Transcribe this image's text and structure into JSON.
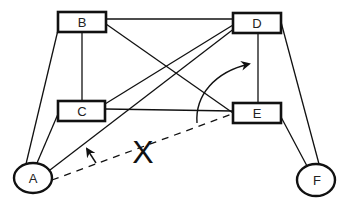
{
  "diagram": {
    "nodes": [
      {
        "id": "B",
        "label": "B",
        "shape": "rect",
        "x": 58,
        "y": 12,
        "w": 48,
        "h": 20
      },
      {
        "id": "C",
        "label": "C",
        "shape": "rect",
        "x": 58,
        "y": 101,
        "w": 47,
        "h": 20
      },
      {
        "id": "D",
        "label": "D",
        "shape": "rect",
        "x": 233,
        "y": 13,
        "w": 48,
        "h": 20
      },
      {
        "id": "E",
        "label": "E",
        "shape": "rect",
        "x": 233,
        "y": 103,
        "w": 48,
        "h": 20
      },
      {
        "id": "A",
        "label": "A",
        "shape": "ellipse",
        "cx": 33,
        "cy": 178,
        "rx": 19,
        "ry": 15
      },
      {
        "id": "F",
        "label": "F",
        "shape": "ellipse",
        "cx": 316,
        "cy": 180,
        "rx": 19,
        "ry": 16
      }
    ],
    "edges": [
      {
        "from": "B",
        "to": "D",
        "style": "solid"
      },
      {
        "from": "B",
        "to": "C",
        "style": "solid"
      },
      {
        "from": "B",
        "to": "E",
        "style": "solid"
      },
      {
        "from": "B",
        "to": "A",
        "style": "solid"
      },
      {
        "from": "C",
        "to": "A",
        "style": "solid"
      },
      {
        "from": "C",
        "to": "D",
        "style": "solid"
      },
      {
        "from": "C",
        "to": "E",
        "style": "solid"
      },
      {
        "from": "A",
        "to": "D",
        "style": "solid"
      },
      {
        "from": "D",
        "to": "E",
        "style": "solid"
      },
      {
        "from": "D",
        "to": "F",
        "style": "solid"
      },
      {
        "from": "E",
        "to": "F",
        "style": "solid"
      },
      {
        "from": "A",
        "to": "E",
        "style": "dashed"
      }
    ],
    "annotation_label": "X",
    "arrows": [
      {
        "name": "rotation-arrow-small",
        "description": "small arrow from dashed A-E line pointing toward A-D line"
      },
      {
        "name": "rotation-arrow-curved",
        "description": "curved arrow from dashed A-E line sweeping up toward D-E line"
      }
    ]
  }
}
